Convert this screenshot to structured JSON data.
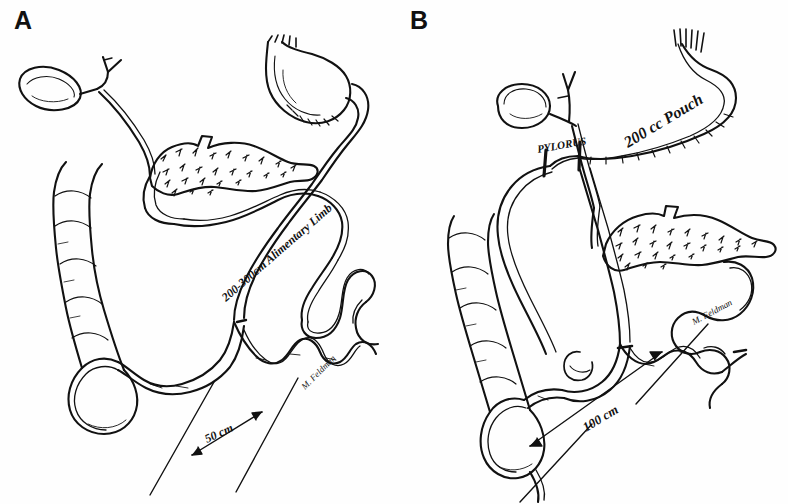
{
  "figure": {
    "kind": "hand-drawn-medical-illustration",
    "background_color": "#fefefe",
    "ink_color": "#111111",
    "artist_signature": "M. Feldman"
  },
  "panels": [
    {
      "id": "A",
      "label": "A",
      "procedure": "Biliopancreatic diversion (long-limb gastric bypass)",
      "annotations": [
        {
          "name": "alimentary-limb-label",
          "text": "200-300cm Alimentary Limb",
          "rotation": -40
        },
        {
          "name": "common-channel-label",
          "text": "50 cm",
          "rotation": -25
        },
        {
          "name": "signature",
          "text": "M. Feldman",
          "rotation": -45
        }
      ],
      "structures": [
        "gallbladder",
        "cystic-duct",
        "common-bile-duct",
        "pancreas",
        "gastric-pouch",
        "esophagus-staple-line",
        "duodenum",
        "jejunum",
        "alimentary-limb",
        "biliopancreatic-limb",
        "jejunoileal-anastomosis",
        "ileum",
        "cecum",
        "ascending-colon",
        "small-bowel-loops"
      ]
    },
    {
      "id": "B",
      "label": "B",
      "procedure": "Duodenal switch with sleeve gastrectomy",
      "annotations": [
        {
          "name": "pylorus-label",
          "text": "PYLORUS",
          "rotation": -12
        },
        {
          "name": "pouch-volume-label",
          "text": "200 cc Pouch",
          "rotation": -32
        },
        {
          "name": "common-channel-label",
          "text": "100 cm",
          "rotation": -30
        },
        {
          "name": "signature",
          "text": "M. Feldman",
          "rotation": -28
        }
      ],
      "structures": [
        "gallbladder",
        "cystic-duct",
        "common-bile-duct",
        "pancreas",
        "sleeve-gastric-pouch",
        "esophagus-staple-line",
        "pylorus",
        "duodenal-stump",
        "duodenoileal-anastomosis",
        "alimentary-limb",
        "biliopancreatic-limb",
        "ileoileal-anastomosis",
        "ileum",
        "cecum",
        "ascending-colon",
        "appendix",
        "small-bowel-loops"
      ]
    }
  ]
}
